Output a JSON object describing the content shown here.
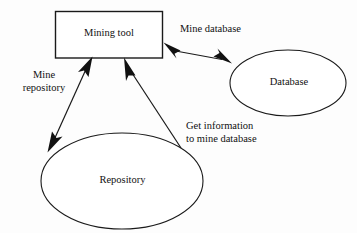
{
  "diagram": {
    "background_color": "#fdfdfd",
    "stroke_color": "#1a1a1a",
    "text_color": "#111111",
    "nodes": [
      {
        "id": "mining-tool",
        "label": "Mining tool",
        "shape": "rectangle",
        "x": 55,
        "y": 11,
        "width": 108,
        "height": 47
      },
      {
        "id": "database",
        "label": "Database",
        "shape": "ellipse",
        "cx": 288,
        "cy": 83,
        "rx": 58,
        "ry": 33
      },
      {
        "id": "repository",
        "label": "Repository",
        "shape": "ellipse",
        "cx": 122,
        "cy": 181,
        "rx": 81,
        "ry": 48
      }
    ],
    "edges": [
      {
        "id": "mine-database",
        "label": "Mine database",
        "label_lines": [
          "Mine database"
        ],
        "from": "mining-tool",
        "to": "database",
        "arrow": "double"
      },
      {
        "id": "mine-repository",
        "label": "Mine repository",
        "label_lines": [
          "Mine",
          "repository"
        ],
        "from": "repository",
        "to": "mining-tool",
        "arrow": "double"
      },
      {
        "id": "get-information",
        "label": "Get information to mine database",
        "label_lines": [
          "Get information",
          "to mine database"
        ],
        "from": "repository",
        "to": "mining-tool",
        "arrow": "single"
      }
    ]
  }
}
